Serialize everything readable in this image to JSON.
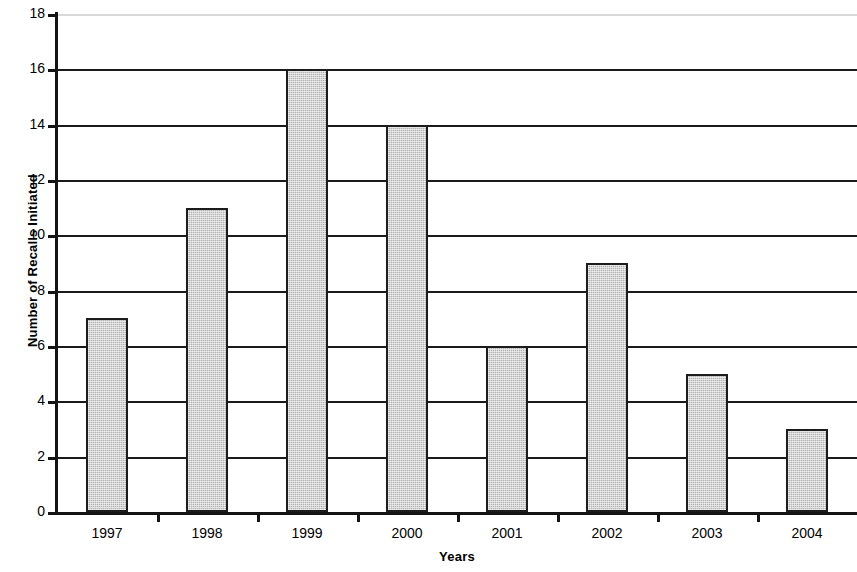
{
  "chart_data": {
    "type": "bar",
    "title": "",
    "subtitle": "",
    "xlabel": "Years",
    "ylabel": "Number of Recalls Initiated",
    "categories": [
      "1997",
      "1998",
      "1999",
      "2000",
      "2001",
      "2002",
      "2003",
      "2004"
    ],
    "values": [
      7,
      11,
      16,
      14,
      6,
      9,
      5,
      3
    ],
    "series": [
      {
        "name": "Number of Recalls Initiated",
        "values": [
          7,
          11,
          16,
          14,
          6,
          9,
          5,
          3
        ]
      }
    ],
    "ylim": [
      0,
      18
    ],
    "ytick_interval": 2,
    "yticks": [
      "18",
      "16",
      "14",
      "12",
      "10",
      "8",
      "6",
      "4",
      "2",
      "0"
    ],
    "ytick_values": [
      18,
      16,
      14,
      12,
      10,
      8,
      6,
      4,
      2,
      0
    ],
    "grid": "horizontal",
    "legend": "none",
    "bar_fill_color": "#b4b4b4",
    "bar_border_color": "#1c1c1c",
    "axis_color": "#141414",
    "gridline_color": "#1a1a1a",
    "top_gridline_color": "#d8d8d8",
    "background_color": "#ffffff"
  }
}
